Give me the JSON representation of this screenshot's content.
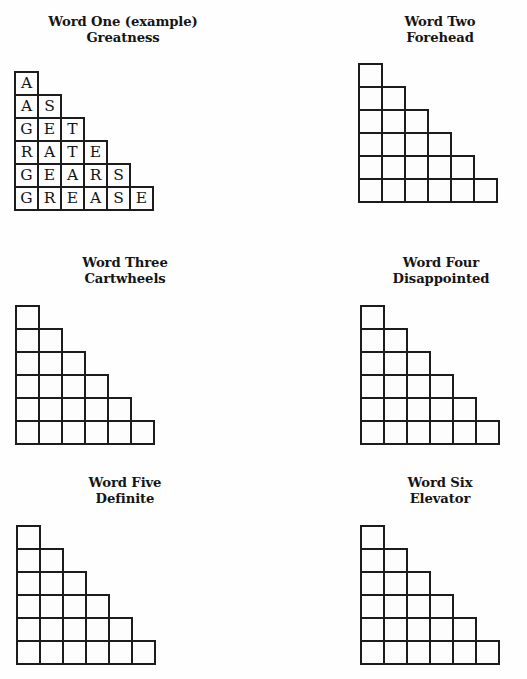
{
  "page": {
    "background_color": "#fefefe",
    "ink_color": "#1c1c1c"
  },
  "puzzles": [
    {
      "id": "word-one",
      "title_line1": "Word One (example)",
      "title_line2": "Greatness",
      "solved": true,
      "rows": [
        [
          "A"
        ],
        [
          "A",
          "S"
        ],
        [
          "G",
          "E",
          "T"
        ],
        [
          "R",
          "A",
          "T",
          "E"
        ],
        [
          "G",
          "E",
          "A",
          "R",
          "S"
        ],
        [
          "G",
          "R",
          "E",
          "A",
          "S",
          "E"
        ]
      ]
    },
    {
      "id": "word-two",
      "title_line1": "Word Two",
      "title_line2": "Forehead",
      "solved": false,
      "rows": [
        [
          ""
        ],
        [
          "",
          ""
        ],
        [
          "",
          "",
          ""
        ],
        [
          "",
          "",
          "",
          ""
        ],
        [
          "",
          "",
          "",
          "",
          ""
        ],
        [
          "",
          "",
          "",
          "",
          "",
          ""
        ]
      ]
    },
    {
      "id": "word-three",
      "title_line1": "Word Three",
      "title_line2": "Cartwheels",
      "solved": false,
      "rows": [
        [
          ""
        ],
        [
          "",
          ""
        ],
        [
          "",
          "",
          ""
        ],
        [
          "",
          "",
          "",
          ""
        ],
        [
          "",
          "",
          "",
          "",
          ""
        ],
        [
          "",
          "",
          "",
          "",
          "",
          ""
        ]
      ]
    },
    {
      "id": "word-four",
      "title_line1": "Word Four",
      "title_line2": "Disappointed",
      "solved": false,
      "rows": [
        [
          ""
        ],
        [
          "",
          ""
        ],
        [
          "",
          "",
          ""
        ],
        [
          "",
          "",
          "",
          ""
        ],
        [
          "",
          "",
          "",
          "",
          ""
        ],
        [
          "",
          "",
          "",
          "",
          "",
          ""
        ]
      ]
    },
    {
      "id": "word-five",
      "title_line1": "Word Five",
      "title_line2": "Definite",
      "solved": false,
      "rows": [
        [
          ""
        ],
        [
          "",
          ""
        ],
        [
          "",
          "",
          ""
        ],
        [
          "",
          "",
          "",
          ""
        ],
        [
          "",
          "",
          "",
          "",
          ""
        ],
        [
          "",
          "",
          "",
          "",
          "",
          ""
        ]
      ]
    },
    {
      "id": "word-six",
      "title_line1": "Word Six",
      "title_line2": "Elevator",
      "solved": false,
      "rows": [
        [
          ""
        ],
        [
          "",
          ""
        ],
        [
          "",
          "",
          ""
        ],
        [
          "",
          "",
          "",
          ""
        ],
        [
          "",
          "",
          "",
          "",
          ""
        ],
        [
          "",
          "",
          "",
          "",
          "",
          ""
        ]
      ]
    }
  ]
}
